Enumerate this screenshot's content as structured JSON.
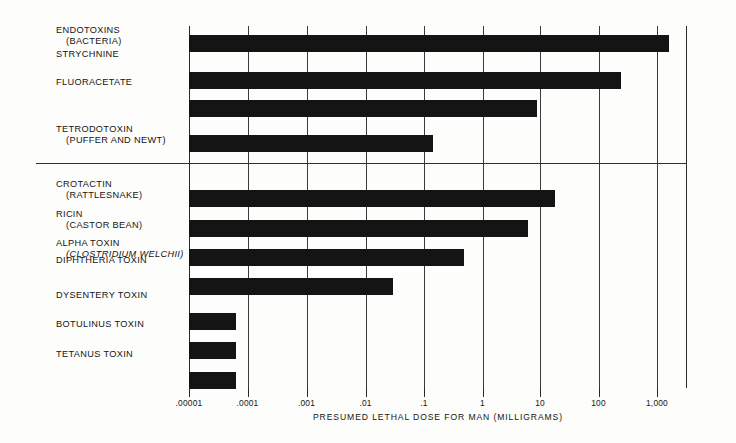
{
  "chart_data": {
    "type": "bar",
    "orientation": "horizontal",
    "title": "",
    "xlabel": "PRESUMED LETHAL DOSE FOR MAN (MILLIGRAMS)",
    "ylabel": "",
    "xscale": "log",
    "xlim": [
      1e-05,
      3000
    ],
    "xticks": [
      1e-05,
      0.0001,
      0.001,
      0.01,
      0.1,
      1,
      10,
      100,
      1000
    ],
    "xticklabels": [
      ".00001",
      ".0001",
      ".001",
      ".01",
      ".1",
      "1",
      "10",
      "100",
      "1,000"
    ],
    "grid": "vertical",
    "legend": null,
    "group_divider_after_index": 3,
    "categories": [
      "ENDOTOXINS (BACTERIA)",
      "STRYCHNINE",
      "FLUORACETATE",
      "TETRODOTOXIN (PUFFER AND NEWT)",
      "CROTACTIN (RATTLESNAKE)",
      "RICIN (CASTOR BEAN)",
      "ALPHA TOXIN (CLOSTRIDIUM WELCHII)",
      "DIPHTHERIA TOXIN",
      "DYSENTERY TOXIN",
      "BOTULINUS TOXIN",
      "TETANUS TOXIN"
    ],
    "values": [
      700,
      45,
      3.5,
      1.3,
      6.0,
      2.6,
      0.25,
      0.02,
      5e-05,
      5e-05,
      5e-05
    ],
    "bars": [
      {
        "label_line1": "ENDOTOXINS",
        "label_line2": "(BACTERIA)",
        "italic2": false,
        "value": 700,
        "bar_x": 0,
        "bar_w": 480,
        "bar_y": 9,
        "label_y": 25
      },
      {
        "label_line1": "STRYCHNINE",
        "label_line2": "",
        "italic2": false,
        "value": 45,
        "bar_x": 0,
        "bar_w": 432,
        "bar_y": 46,
        "label_y": 49
      },
      {
        "label_line1": "FLUORACETATE",
        "label_line2": "",
        "italic2": false,
        "value": 3.5,
        "bar_x": 0,
        "bar_w": 348,
        "bar_y": 74,
        "label_y": 77
      },
      {
        "label_line1": "TETRODOTOXIN",
        "label_line2": "(PUFFER AND NEWT)",
        "italic2": false,
        "value": 1.3,
        "bar_x": 0,
        "bar_w": 244,
        "bar_y": 109,
        "label_y": 124
      },
      {
        "label_line1": "CROTACTIN",
        "label_line2": "(RATTLESNAKE)",
        "italic2": false,
        "value": 6.0,
        "bar_x": 0,
        "bar_w": 366,
        "bar_y": 164,
        "label_y": 179
      },
      {
        "label_line1": "RICIN",
        "label_line2": "(CASTOR BEAN)",
        "italic2": false,
        "value": 2.6,
        "bar_x": 0,
        "bar_w": 339,
        "bar_y": 194,
        "label_y": 209
      },
      {
        "label_line1": "ALPHA TOXIN",
        "label_line2": "(CLOSTRIDIUM WELCHII)",
        "italic2": true,
        "value": 0.25,
        "bar_x": 0,
        "bar_w": 275,
        "bar_y": 223,
        "label_y": 238
      },
      {
        "label_line1": "DIPHTHERIA TOXIN",
        "label_line2": "",
        "italic2": false,
        "value": 0.02,
        "bar_x": 0,
        "bar_w": 204,
        "bar_y": 252,
        "label_y": 255
      },
      {
        "label_line1": "DYSENTERY TOXIN",
        "label_line2": "",
        "italic2": false,
        "value": 5e-05,
        "bar_x": 0,
        "bar_w": 47,
        "bar_y": 287,
        "label_y": 290
      },
      {
        "label_line1": "BOTULINUS TOXIN",
        "label_line2": "",
        "italic2": false,
        "value": 5e-05,
        "bar_x": 0,
        "bar_w": 47,
        "bar_y": 316,
        "label_y": 319
      },
      {
        "label_line1": "TETANUS TOXIN",
        "label_line2": "",
        "italic2": false,
        "value": 5e-05,
        "bar_x": 0,
        "bar_w": 47,
        "bar_y": 346,
        "label_y": 349
      }
    ],
    "tick_positions_px": [
      0,
      58.5,
      117.5,
      176.5,
      235,
      293.5,
      351,
      409.5,
      468
    ]
  }
}
